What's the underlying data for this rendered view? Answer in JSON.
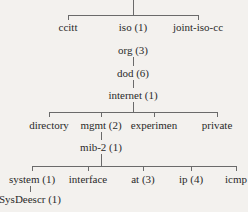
{
  "diagram": {
    "type": "tree",
    "title": "",
    "nodes": {
      "ccitt": "ccitt",
      "iso": "iso (1)",
      "joint": "joint-iso-cc",
      "org": "org (3)",
      "dod": "dod (6)",
      "internet": "internet (1)",
      "directory": "directory",
      "mgmt": "mgmt (2)",
      "experimen": "experimen",
      "private": "private",
      "mib2": "mib-2 (1)",
      "system": "system (1)",
      "interface": "interface",
      "at": "at (3)",
      "ip": "ip (4)",
      "icmp": "icmp",
      "sysdescr": "SysDeescr (1)"
    },
    "edges": [
      [
        "root",
        "ccitt"
      ],
      [
        "root",
        "iso"
      ],
      [
        "root",
        "joint"
      ],
      [
        "iso",
        "org"
      ],
      [
        "org",
        "dod"
      ],
      [
        "dod",
        "internet"
      ],
      [
        "internet",
        "directory"
      ],
      [
        "internet",
        "mgmt"
      ],
      [
        "internet",
        "experimen"
      ],
      [
        "internet",
        "private"
      ],
      [
        "mgmt",
        "mib2"
      ],
      [
        "mib2",
        "system"
      ],
      [
        "mib2",
        "interface"
      ],
      [
        "mib2",
        "at"
      ],
      [
        "mib2",
        "ip"
      ],
      [
        "mib2",
        "icmp"
      ],
      [
        "system",
        "sysdescr"
      ]
    ]
  }
}
